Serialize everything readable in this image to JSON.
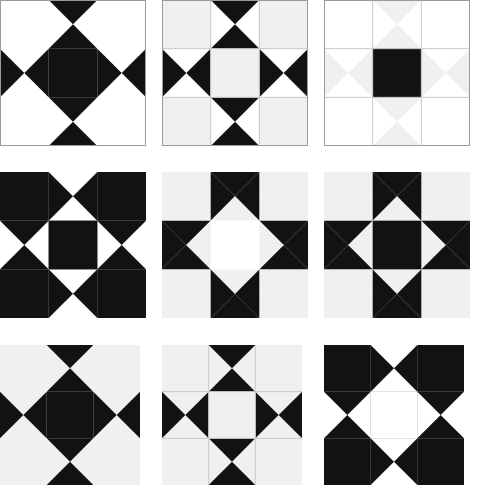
{
  "page": {
    "width": 488,
    "height": 485,
    "background": "#ffffff"
  },
  "palette": {
    "black": "#121212",
    "white": "#ffffff",
    "light_gray": "#f0f0f0",
    "border_gray": "#9a9a9a",
    "thin_line_gray": "#c8c8c8",
    "background": "#ffffff"
  },
  "layout": {
    "rows": 3,
    "columns": 3,
    "column_widths": [
      162,
      162,
      164
    ],
    "row_heights": [
      172,
      173,
      140
    ],
    "block_origins": [
      {
        "x": 6,
        "y": 6
      },
      {
        "x": 172,
        "y": 6
      },
      {
        "x": 333,
        "y": 6
      },
      {
        "x": 6,
        "y": 172
      },
      {
        "x": 172,
        "y": 172
      },
      {
        "x": 333,
        "y": 172
      },
      {
        "x": 6,
        "y": 345
      },
      {
        "x": 172,
        "y": 345
      },
      {
        "x": 333,
        "y": 345
      }
    ]
  },
  "unit_legend": {
    "corner": "Plain square in each of the four corners of a block",
    "edge": "Quarter-square triangle (hourglass) unit on each of the four block edges",
    "center": "Plain square at the middle of the block"
  },
  "blocks": [
    {
      "id": "block-1",
      "name": "ohio-star-black-center",
      "row": 1,
      "column": 1,
      "size": 146,
      "border": true,
      "border_color": "#9a9a9a",
      "inner_lines": false,
      "corner_fill": "#ffffff",
      "center_fill": "#121212",
      "edge_style": "points-inward",
      "edge_point_fill": "#121212",
      "edge_background_fill": "#ffffff",
      "edge_notch_fill": "#ffffff"
    },
    {
      "id": "block-2",
      "name": "ohio-star-light-center",
      "row": 1,
      "column": 2,
      "size": 146,
      "border": true,
      "border_color": "#9a9a9a",
      "inner_lines": true,
      "corner_fill": "#f0f0f0",
      "center_fill": "#f0f0f0",
      "edge_style": "points-inward",
      "edge_point_fill": "#121212",
      "edge_background_fill": "#ffffff",
      "edge_notch_fill": "#ffffff"
    },
    {
      "id": "block-3",
      "name": "ohio-star-ghost-black-center",
      "row": 1,
      "column": 3,
      "size": 146,
      "border": true,
      "border_color": "#9a9a9a",
      "inner_lines": true,
      "corner_fill": "#ffffff",
      "center_fill": "#121212",
      "edge_style": "points-inward",
      "edge_point_fill": "#f0f0f0",
      "edge_background_fill": "#ffffff",
      "edge_notch_fill": "#ffffff"
    },
    {
      "id": "block-4",
      "name": "ohio-star-reverse-black-corners",
      "row": 2,
      "column": 1,
      "size": 146,
      "border": false,
      "border_color": "#9a9a9a",
      "inner_lines": false,
      "corner_fill": "#121212",
      "center_fill": "#121212",
      "edge_style": "points-inward",
      "edge_point_fill": "#ffffff",
      "edge_background_fill": "#121212",
      "edge_notch_fill": "#121212"
    },
    {
      "id": "block-5",
      "name": "eight-point-star-light-center",
      "row": 2,
      "column": 2,
      "size": 146,
      "border": false,
      "border_color": "#9a9a9a",
      "inner_lines": false,
      "corner_fill": "#f0f0f0",
      "center_fill": "#ffffff",
      "edge_style": "points-outward",
      "edge_point_fill": "#121212",
      "edge_background_fill": "#f0f0f0",
      "edge_notch_fill": "#f0f0f0"
    },
    {
      "id": "block-6",
      "name": "eight-point-star-solid-black",
      "row": 2,
      "column": 3,
      "size": 146,
      "border": false,
      "border_color": "#9a9a9a",
      "inner_lines": false,
      "corner_fill": "#f0f0f0",
      "center_fill": "#121212",
      "edge_style": "points-outward",
      "edge_point_fill": "#121212",
      "edge_background_fill": "#f0f0f0",
      "edge_notch_fill": "#f0f0f0"
    },
    {
      "id": "block-7",
      "name": "ohio-star-black-center-borderless",
      "row": 3,
      "column": 1,
      "size": 140,
      "border": false,
      "border_color": "#9a9a9a",
      "inner_lines": false,
      "corner_fill": "#f0f0f0",
      "center_fill": "#121212",
      "edge_style": "points-inward",
      "edge_point_fill": "#121212",
      "edge_background_fill": "#f0f0f0",
      "edge_notch_fill": "#f0f0f0"
    },
    {
      "id": "block-8",
      "name": "ohio-star-outlined-center",
      "row": 3,
      "column": 2,
      "size": 140,
      "border": false,
      "border_color": "#9a9a9a",
      "inner_lines": true,
      "corner_fill": "#f0f0f0",
      "center_fill": "#f0f0f0",
      "edge_style": "points-inward",
      "edge_point_fill": "#121212",
      "edge_background_fill": "#f0f0f0",
      "edge_notch_fill": "#f0f0f0"
    },
    {
      "id": "block-9",
      "name": "ohio-star-black-corners-white-center",
      "row": 3,
      "column": 3,
      "size": 140,
      "border": false,
      "border_color": "#9a9a9a",
      "inner_lines": false,
      "corner_fill": "#121212",
      "center_fill": "#ffffff",
      "edge_style": "points-inward",
      "edge_point_fill": "#ffffff",
      "edge_background_fill": "#121212",
      "edge_notch_fill": "#121212"
    }
  ]
}
